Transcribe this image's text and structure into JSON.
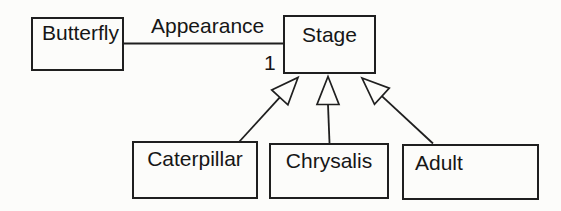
{
  "diagram": {
    "type": "uml-class-diagram",
    "nodes": {
      "butterfly": {
        "label": "Butterfly"
      },
      "stage": {
        "label": "Stage"
      },
      "caterpillar": {
        "label": "Caterpillar"
      },
      "chrysalis": {
        "label": "Chrysalis"
      },
      "adult": {
        "label": "Adult"
      }
    },
    "association": {
      "from": "Butterfly",
      "to": "Stage",
      "label": "Appearance",
      "multiplicity": "1"
    },
    "generalizations": [
      {
        "from": "Caterpillar",
        "to": "Stage"
      },
      {
        "from": "Chrysalis",
        "to": "Stage"
      },
      {
        "from": "Adult",
        "to": "Stage"
      }
    ],
    "colors": {
      "line": "#1f1f1f",
      "text": "#161616",
      "background": "#fcfcfa",
      "node_fill": "#fcfcfa"
    }
  }
}
